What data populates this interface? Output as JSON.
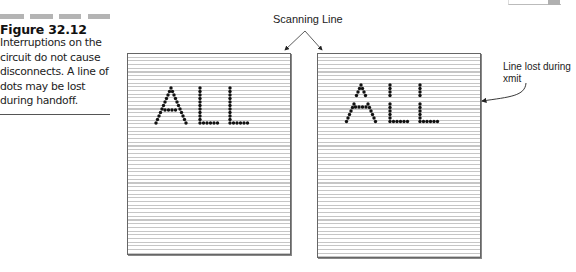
{
  "figure": {
    "number_label": "Figure 32.12",
    "caption": "Interruptions on the circuit do not cause disconnects. A line of dots may be lost during handoff."
  },
  "diagram": {
    "scanning_line_label": "Scanning Line",
    "line_lost_label": "Line lost during xmit",
    "left_panel_text": "ALL",
    "right_panel_text": "ALL",
    "colors": {
      "scan_lines": "#c6c6c6",
      "panel_border": "#666666",
      "dots": "#111111",
      "header_bars": "#b4b4b4"
    }
  }
}
